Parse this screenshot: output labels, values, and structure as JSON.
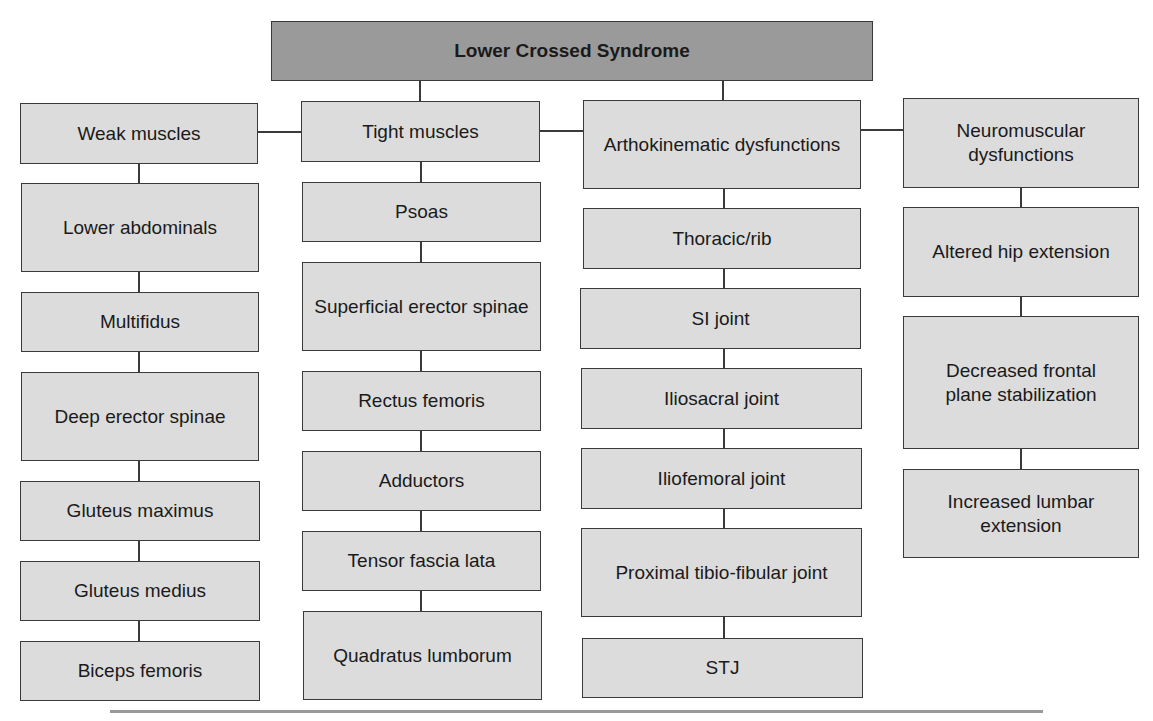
{
  "title": "Lower Crossed Syndrome",
  "columns": [
    {
      "header": "Weak muscles",
      "items": [
        "Lower abdominals",
        "Multifidus",
        "Deep erector spinae",
        "Gluteus maximus",
        "Gluteus medius",
        "Biceps femoris"
      ]
    },
    {
      "header": "Tight muscles",
      "items": [
        "Psoas",
        "Superficial erector spinae",
        "Rectus femoris",
        "Adductors",
        "Tensor fascia lata",
        "Quadratus lumborum"
      ]
    },
    {
      "header": "Arthokinematic dysfunctions",
      "items": [
        "Thoracic/rib",
        "SI joint",
        "Iliosacral joint",
        "Iliofemoral joint",
        "Proximal tibio-fibular joint",
        "STJ"
      ]
    },
    {
      "header": "Neuromuscular dysfunctions",
      "items": [
        "Altered hip extension",
        "Decreased frontal plane stabilization",
        "Increased lumbar extension"
      ]
    }
  ],
  "colors": {
    "title_fill": "#9a9a9a",
    "box_fill": "#dcdcdc",
    "border": "#3a3a3a"
  }
}
